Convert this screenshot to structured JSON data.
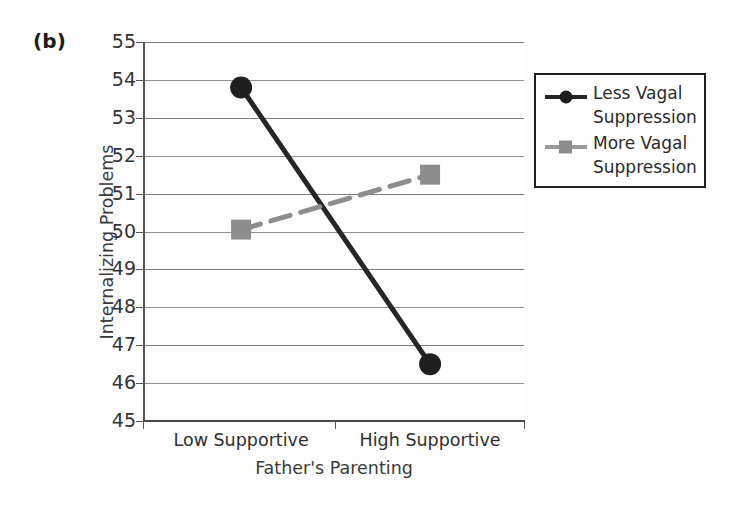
{
  "figure": {
    "panel_label": "(b)",
    "background_color": "#fdfdfd"
  },
  "chart_data": {
    "type": "line",
    "title": "",
    "subtitle": "",
    "xlabel": "Father's Parenting",
    "ylabel": "Internalizing Problems",
    "categories": [
      "Low Supportive",
      "High Supportive"
    ],
    "x": [
      0,
      1
    ],
    "ylim": [
      45,
      55
    ],
    "yticks": [
      55,
      54,
      53,
      52,
      51,
      50,
      49,
      48,
      47,
      46,
      45
    ],
    "ytick_labels": [
      "55",
      "54",
      "53",
      "52",
      "51",
      "50",
      "49",
      "48",
      "47",
      "46",
      "45"
    ],
    "grid": true,
    "grid_axis": "y",
    "legend_position": "right",
    "series": [
      {
        "name": "Less Vagal Suppression",
        "label_line1": "Less Vagal",
        "label_line2": "Suppression",
        "values": [
          53.8,
          46.5
        ],
        "color": "#262626",
        "marker": "circle",
        "linestyle": "solid",
        "linewidth": 5
      },
      {
        "name": "More Vagal Suppression",
        "label_line1": "More Vagal",
        "label_line2": "Suppression",
        "values": [
          50.05,
          51.5
        ],
        "color": "#8d8d8d",
        "marker": "square",
        "linestyle": "dashed",
        "linewidth": 5
      }
    ],
    "annotations": []
  },
  "axes": {
    "y_axis_color": "#545454",
    "x_axis_color": "#4a4a4a",
    "gridline_color": "#7d7d7d"
  },
  "legend": {
    "border_color": "#1e1e1e",
    "background_color": "#ffffff",
    "entries": [
      {
        "line1": "Less Vagal",
        "line2": "Suppression",
        "color": "#262626",
        "marker": "circle"
      },
      {
        "line1": "More Vagal",
        "line2": "Suppression",
        "color": "#8d8d8d",
        "marker": "square"
      }
    ]
  }
}
